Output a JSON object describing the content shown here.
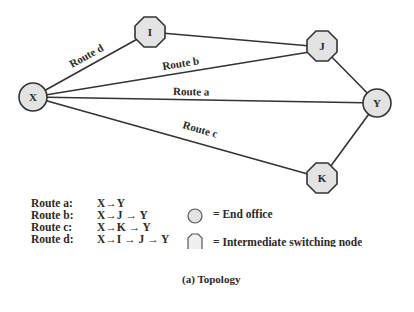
{
  "diagram": {
    "nodes": [
      {
        "id": "X",
        "type": "end-office"
      },
      {
        "id": "I",
        "type": "intermediate-switching-node"
      },
      {
        "id": "J",
        "type": "intermediate-switching-node"
      },
      {
        "id": "Y",
        "type": "end-office"
      },
      {
        "id": "K",
        "type": "intermediate-switching-node"
      }
    ],
    "edge_labels": {
      "route_d": "Route d",
      "route_b": "Route b",
      "route_a": "Route a",
      "route_c": "Route c"
    },
    "colors": {
      "node_fill": "#e3e3e3",
      "stroke": "#333333"
    }
  },
  "routes": [
    {
      "name": "Route a:",
      "path": "X→Y"
    },
    {
      "name": "Route b:",
      "path": "X→J → Y"
    },
    {
      "name": "Route c:",
      "path": "X→K → Y"
    },
    {
      "name": "Route d:",
      "path": "X→I → J → Y"
    }
  ],
  "legend": {
    "end_office": "= End office",
    "intermediate": "= Intermediate switching node"
  },
  "caption": "(a) Topology"
}
